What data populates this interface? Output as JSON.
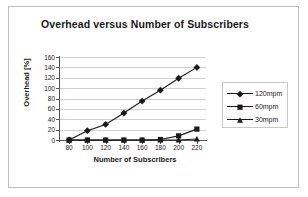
{
  "chart_data": {
    "type": "line",
    "title": "Overhead versus Number of Subscribers",
    "xlabel": "Number of Subscribers",
    "ylabel": "Overhead [%]",
    "x": [
      80,
      100,
      120,
      140,
      160,
      180,
      200,
      220
    ],
    "xtick_labels": [
      "80",
      "100",
      "120",
      "140",
      "160",
      "180",
      "200",
      "220"
    ],
    "ytick_labels": [
      "0",
      "20",
      "40",
      "60",
      "80",
      "100",
      "120",
      "140",
      "160"
    ],
    "yticks": [
      0,
      20,
      40,
      60,
      80,
      100,
      120,
      140,
      160
    ],
    "ylim": [
      0,
      160
    ],
    "xlim": [
      70,
      230
    ],
    "grid": "horizontal",
    "legend_position": "right",
    "series": [
      {
        "name": "120mpm",
        "marker": "diamond",
        "color": "#1a1a1a",
        "values": [
          0,
          18,
          30,
          52,
          75,
          96,
          119,
          140
        ]
      },
      {
        "name": "60mpm",
        "marker": "square",
        "color": "#1a1a1a",
        "values": [
          0,
          0,
          0,
          0,
          0,
          1,
          8,
          21
        ]
      },
      {
        "name": "30mpm",
        "marker": "triangle",
        "color": "#1a1a1a",
        "values": [
          0,
          0,
          0,
          0,
          0,
          0,
          0,
          2
        ]
      }
    ]
  },
  "legend": {
    "items": [
      {
        "label": "120mpm"
      },
      {
        "label": "60mpm"
      },
      {
        "label": "30mpm"
      }
    ]
  },
  "colors": {
    "ink": "#1a1a1a",
    "gridline": "#d0d0d0",
    "frame": "#bfbfbf",
    "background": "#ffffff"
  }
}
